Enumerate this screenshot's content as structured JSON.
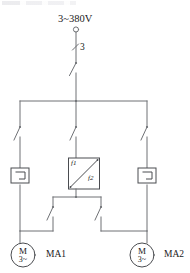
{
  "diagram": {
    "title": "3~380V",
    "supply": {
      "label": "3~380V",
      "terminal": "supply-terminal"
    },
    "phase_marker": {
      "label": "3"
    },
    "main_switch": {
      "name": "main-disconnect-switch"
    },
    "bus": {
      "name": "three-phase-bus"
    },
    "contactors": [
      {
        "id": "left",
        "name": "contactor-left"
      },
      {
        "id": "middle",
        "name": "contactor-middle"
      },
      {
        "id": "right",
        "name": "contactor-right"
      }
    ],
    "overload_relays": [
      {
        "id": "left",
        "name": "thermal-overload-relay-left"
      },
      {
        "id": "right",
        "name": "thermal-overload-relay-right"
      }
    ],
    "changeover_block": {
      "name": "changeover-block",
      "label_top": "f1",
      "label_bottom": "f2"
    },
    "lower_switches": [
      {
        "id": "left",
        "name": "changeover-switch-left"
      },
      {
        "id": "right",
        "name": "changeover-switch-right"
      }
    ],
    "motors": [
      {
        "id": "ma1",
        "name": "MA1",
        "symbol": "M",
        "phase": "3~"
      },
      {
        "id": "ma2",
        "name": "MA2",
        "symbol": "M",
        "phase": "3~"
      }
    ],
    "colors": {
      "wire": "#6f7175",
      "symbol": "#4a4c50",
      "text": "#1a1a1a",
      "background": "#ffffff"
    }
  }
}
